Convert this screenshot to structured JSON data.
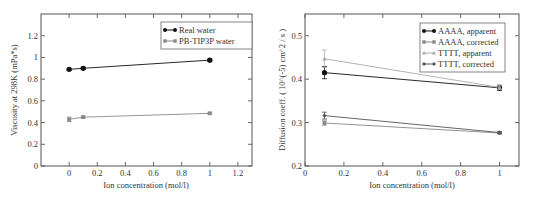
{
  "chart_data": [
    {
      "type": "line",
      "title": "",
      "xlabel": "Ion concentration (mol/l)",
      "ylabel": "Viscosity at 298K (mPa*s)",
      "xlim": [
        -0.2,
        1.3
      ],
      "ylim": [
        0,
        1.4
      ],
      "xticks": [
        0,
        0.2,
        0.4,
        0.6,
        0.8,
        1,
        1.2
      ],
      "xtick_labels": [
        "0",
        "0.2",
        "0.4",
        "0.6",
        "0.8",
        "1",
        "1.2"
      ],
      "yticks": [
        0,
        0.2,
        0.4,
        0.6,
        0.8,
        1,
        1.2
      ],
      "ytick_labels": [
        "0",
        "0.2",
        "0.4",
        "0.6",
        "0.8",
        "1",
        "1.2"
      ],
      "legend_position": "top-right",
      "grid": false,
      "series": [
        {
          "name": "Real water",
          "marker": "circle",
          "color": "#111111",
          "x": [
            0,
            0.1,
            1
          ],
          "y": [
            0.89,
            0.9,
            0.975
          ],
          "err": [
            0.01,
            0.01,
            0.01
          ]
        },
        {
          "name": "PB-TIP3P water",
          "marker": "square",
          "color": "#888888",
          "x": [
            0,
            0.1,
            1
          ],
          "y": [
            0.43,
            0.45,
            0.485
          ],
          "err": [
            0.02,
            0.01,
            0.01
          ]
        }
      ]
    },
    {
      "type": "line",
      "title": "",
      "xlabel": "Ion concentration (mol/l)",
      "ylabel": "Diffusion coeff. ( 10^(-5) cm^2 / s )",
      "xlim": [
        0,
        1.1
      ],
      "ylim": [
        0.2,
        0.55
      ],
      "xticks": [
        0,
        0.2,
        0.4,
        0.6,
        0.8,
        1
      ],
      "xtick_labels": [
        "0",
        "0.2",
        "0.4",
        "0.6",
        "0.8",
        "1"
      ],
      "yticks": [
        0.2,
        0.3,
        0.4,
        0.5
      ],
      "ytick_labels": [
        "0.2",
        "0.3",
        "0.4",
        "0.5"
      ],
      "legend_position": "top-right",
      "grid": false,
      "series": [
        {
          "name": "AAAA, apparent",
          "marker": "circle",
          "color": "#111111",
          "x": [
            0.1,
            1
          ],
          "y": [
            0.415,
            0.38
          ],
          "err": [
            0.014,
            0.006
          ]
        },
        {
          "name": "AAAA, corrected",
          "marker": "square",
          "color": "#888888",
          "x": [
            0.1,
            1
          ],
          "y": [
            0.299,
            0.276
          ],
          "err": [
            0.005,
            0.002
          ]
        },
        {
          "name": "TTTT, apparent",
          "marker": "triangle",
          "color": "#aaaaaa",
          "x": [
            0.1,
            1
          ],
          "y": [
            0.447,
            0.381
          ],
          "err": [
            0.02,
            0.005
          ]
        },
        {
          "name": "TTTT, corrected",
          "marker": "diamond",
          "color": "#555555",
          "x": [
            0.1,
            1
          ],
          "y": [
            0.316,
            0.277
          ],
          "err": [
            0.008,
            0.002
          ]
        }
      ]
    }
  ]
}
